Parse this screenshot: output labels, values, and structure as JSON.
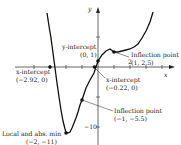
{
  "figure": {
    "axes": {
      "x_label": "x",
      "y_label": "y",
      "x_tick_label": "2",
      "y_tick_label": "−10"
    },
    "function": "f(x) = x^4/2 - 3x^2 + 4x + 1",
    "annotations": [
      {
        "id": "y-intercept",
        "title": "y-intercept",
        "coords": "(0, 1)"
      },
      {
        "id": "inflection-1",
        "title": "Inflection point",
        "coords": "(1, 2.5)"
      },
      {
        "id": "x-intercept-left",
        "title": "x-intercept",
        "coords": "(−2.92, 0)"
      },
      {
        "id": "x-intercept-right",
        "title": "x-intercept",
        "coords": "(−0.22, 0)"
      },
      {
        "id": "inflection-2",
        "title": "Inflection point",
        "coords": "(−1, −5.5)"
      },
      {
        "id": "min",
        "title": "Local and abs. min",
        "coords": "(−2, −11)"
      }
    ],
    "colors": {
      "curve": "#111111",
      "axis": "#222222",
      "text": "#222222"
    }
  }
}
